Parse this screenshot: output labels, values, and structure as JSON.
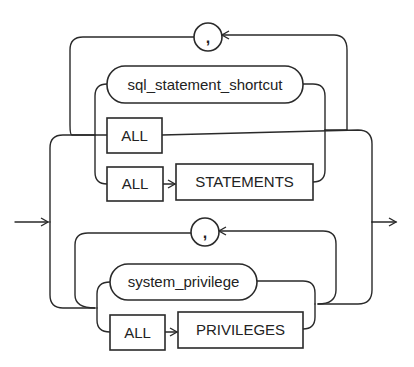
{
  "diagram": {
    "type": "railroad-syntax-diagram",
    "upper_branch": {
      "separator": ",",
      "nonterminal": "sql_statement_shortcut",
      "keyword_all": "ALL",
      "keyword_all_2": "ALL",
      "keyword_statements": "STATEMENTS"
    },
    "lower_branch": {
      "separator": ",",
      "nonterminal": "system_privilege",
      "keyword_all": "ALL",
      "keyword_privileges": "PRIVILEGES"
    },
    "colors": {
      "stroke": "#2a2a2a",
      "background": "#ffffff",
      "text": "#222222"
    }
  }
}
